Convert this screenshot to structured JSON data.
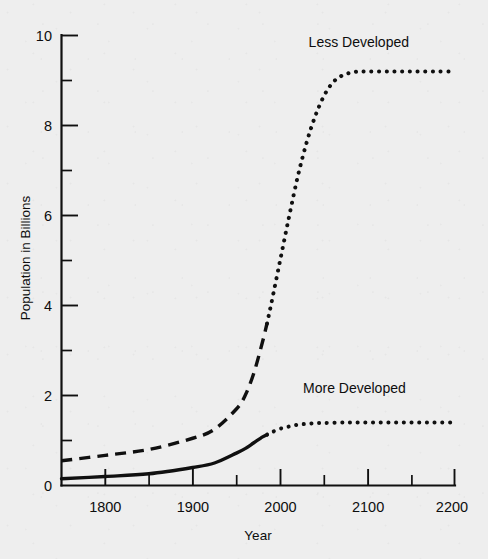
{
  "chart_data": {
    "type": "line",
    "title": "",
    "xlabel": "Year",
    "ylabel": "Population in Billions",
    "xlim": [
      1750,
      2200
    ],
    "ylim": [
      0,
      10
    ],
    "grid": false,
    "legend_position": "inline-annotation",
    "x_ticks_major": [
      1800,
      1900,
      2000,
      2100,
      2200
    ],
    "x_ticks_minor": [
      1750,
      1850,
      1950,
      2050,
      2150
    ],
    "x_tick_labels": [
      "1800",
      "1900",
      "2000",
      "2100",
      "2200"
    ],
    "y_ticks_major": [
      0,
      2,
      4,
      6,
      8,
      10
    ],
    "y_ticks_minor": [
      1,
      3,
      5,
      7,
      9
    ],
    "y_tick_labels": [
      "0",
      "2",
      "4",
      "6",
      "8",
      "10"
    ],
    "annotations": [
      {
        "text": "Less Developed",
        "x": 2090,
        "y": 9.75
      },
      {
        "text": "More Developed",
        "x": 2085,
        "y": 2.05
      }
    ],
    "series": [
      {
        "name": "Less Developed",
        "style_historical": "dashed",
        "style_projected": "dotted",
        "split_year": 1985,
        "x": [
          1750,
          1800,
          1850,
          1900,
          1925,
          1950,
          1960,
          1970,
          1980,
          1985,
          1990,
          2000,
          2010,
          2020,
          2030,
          2040,
          2050,
          2060,
          2070,
          2080,
          2090,
          2100,
          2125,
          2150,
          2175,
          2200
        ],
        "values": [
          0.55,
          0.67,
          0.8,
          1.05,
          1.25,
          1.7,
          2.0,
          2.5,
          3.2,
          3.6,
          4.05,
          5.0,
          5.95,
          6.85,
          7.6,
          8.2,
          8.65,
          8.95,
          9.1,
          9.17,
          9.2,
          9.2,
          9.2,
          9.2,
          9.2,
          9.2
        ]
      },
      {
        "name": "More Developed",
        "style_historical": "solid",
        "style_projected": "dotted",
        "split_year": 1985,
        "x": [
          1750,
          1800,
          1850,
          1900,
          1925,
          1950,
          1960,
          1970,
          1980,
          1985,
          1990,
          2000,
          2010,
          2020,
          2030,
          2040,
          2050,
          2075,
          2100,
          2125,
          2150,
          2175,
          2200
        ],
        "values": [
          0.15,
          0.2,
          0.26,
          0.4,
          0.5,
          0.72,
          0.82,
          0.95,
          1.08,
          1.13,
          1.18,
          1.26,
          1.31,
          1.35,
          1.37,
          1.385,
          1.39,
          1.4,
          1.4,
          1.4,
          1.4,
          1.4,
          1.4
        ]
      }
    ]
  },
  "axes": {
    "y_label": "Population in Billions",
    "x_label": "Year"
  },
  "labels": {
    "less_developed": "Less Developed",
    "more_developed": "More Developed"
  }
}
